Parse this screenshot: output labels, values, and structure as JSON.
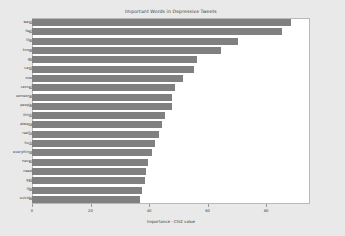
{
  "chart_data": {
    "type": "bar",
    "orientation": "horizontal",
    "title": "Important Words in Depressive Tweets",
    "xlabel": "Importance - Chi2 value",
    "ylabel": "",
    "xlim": [
      0,
      95
    ],
    "ylim": null,
    "grid": false,
    "legend": null,
    "bar_color": "#808080",
    "background_color": "#e9e9e9",
    "plot_background_color": "#ffffff",
    "xticks": [
      0,
      20,
      40,
      60,
      80
    ],
    "xticklabels": [
      "0",
      "20",
      "40",
      "60",
      "80"
    ],
    "categories": [
      "want",
      "feel",
      "like",
      "know",
      "go",
      "cant",
      "one",
      "cancel",
      "someone",
      "people",
      "think",
      "always",
      "really",
      "fuck",
      "everything",
      "never",
      "need",
      "get",
      "life",
      "suicide"
    ],
    "values": [
      88.5,
      85.5,
      70.5,
      64.5,
      56.5,
      55.5,
      51.5,
      49.0,
      48.0,
      48.0,
      45.5,
      44.5,
      43.5,
      42.0,
      41.0,
      39.5,
      39.0,
      38.5,
      37.5,
      37.0
    ]
  }
}
